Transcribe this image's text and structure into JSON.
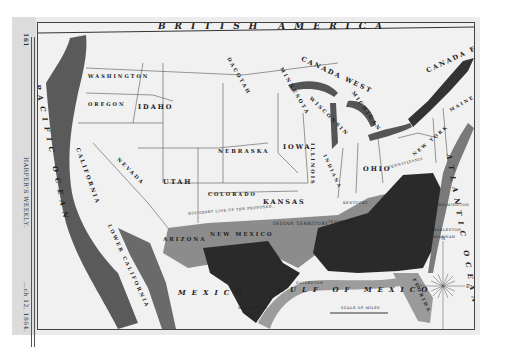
{
  "publication": {
    "name": "HARPER'S WEEKLY.",
    "page_number": "161",
    "date_fragment": "…ch 12, 1864."
  },
  "map": {
    "regions": {
      "north": "BRITISH AMERICA",
      "canada_west": "CANADA WEST",
      "canada_east": "CANADA EAST",
      "mexico": "MEXICO",
      "lower_california": "LOWER CALIFORNIA"
    },
    "waters": {
      "pacific": "PACIFIC OCEAN",
      "atlantic": "ATLANTIC OCEAN",
      "gulf": "GULF OF MEXICO"
    },
    "states": [
      {
        "id": "washington",
        "label": "WASHINGTON"
      },
      {
        "id": "oregon",
        "label": "OREGON"
      },
      {
        "id": "idaho",
        "label": "IDAHO"
      },
      {
        "id": "dakota",
        "label": "DACOTAH"
      },
      {
        "id": "minnesota",
        "label": "MINNESOTA"
      },
      {
        "id": "wisconsin",
        "label": "WISCONSIN"
      },
      {
        "id": "michigan",
        "label": "MICHIGAN"
      },
      {
        "id": "nevada",
        "label": "NEVADA"
      },
      {
        "id": "utah",
        "label": "UTAH"
      },
      {
        "id": "colorado",
        "label": "COLORADO"
      },
      {
        "id": "nebraska",
        "label": "NEBRASKA"
      },
      {
        "id": "iowa",
        "label": "IOWA"
      },
      {
        "id": "illinois",
        "label": "ILLINOIS"
      },
      {
        "id": "indiana",
        "label": "INDIANA"
      },
      {
        "id": "ohio",
        "label": "OHIO"
      },
      {
        "id": "pennsylvania",
        "label": "PENNSYLVANIA"
      },
      {
        "id": "new_york",
        "label": "NEW YORK"
      },
      {
        "id": "maine",
        "label": "MAINE"
      },
      {
        "id": "kansas",
        "label": "KANSAS"
      },
      {
        "id": "california",
        "label": "CALIFORNIA"
      },
      {
        "id": "arizona",
        "label": "ARIZONA"
      },
      {
        "id": "new_mexico",
        "label": "NEW MEXICO"
      },
      {
        "id": "indian_territory",
        "label": "INDIAN TERRITORY"
      },
      {
        "id": "kentucky",
        "label": "KENTUCKY"
      },
      {
        "id": "tennessee",
        "label": "TENNESSEE"
      },
      {
        "id": "florida",
        "label": "FLORIDA"
      }
    ],
    "annotations": {
      "boundary_line": "BOUNDARY LINE OF THE PROPOSED…",
      "scale": "SCALE OF MILES",
      "cities": [
        "MATAMORAS",
        "GALVESTON",
        "CHARLESTON",
        "SAVANNAH",
        "WILMINGTON",
        "NEW YORK"
      ]
    },
    "legend_shading": {
      "dark": "#2a2a2a",
      "medium": "#8c8c8c",
      "land": "#f3f3f3",
      "coast": "#6a6a6a"
    },
    "compass": {
      "n": "N",
      "s": "S",
      "e": "E",
      "w": "W"
    }
  }
}
